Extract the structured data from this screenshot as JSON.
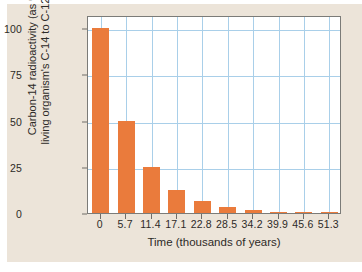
{
  "figure": {
    "background_color": "#ece4d9",
    "plot_background_color": "#ffffff",
    "bar_color": "#ea7b3c",
    "grid_color": "#a9cfe9",
    "axis_color": "#7b7b78"
  },
  "axis_titles": {
    "y_line1": "Carbon-14 radioactivity (as % of",
    "y_line2": "living organism's C-14 to C-12 ratio)",
    "x": "Time (thousands of years)"
  },
  "chart_data": {
    "type": "bar",
    "title": "",
    "xlabel": "Time (thousands of years)",
    "ylabel": "Carbon-14 radioactivity (as % of living organism's C-14 to C-12 ratio)",
    "categories": [
      "0",
      "5.7",
      "11.4",
      "17.1",
      "22.8",
      "28.5",
      "34.2",
      "39.9",
      "45.6",
      "51.3"
    ],
    "values": [
      100,
      50,
      25,
      12.5,
      6.25,
      3.125,
      1.5625,
      0.78,
      0.39,
      0.195
    ],
    "ylim": [
      0,
      107
    ],
    "yticks": [
      "0",
      "25",
      "50",
      "75",
      "100"
    ],
    "ytick_values": [
      0,
      25,
      50,
      75,
      100
    ],
    "xtick_values": [
      0,
      5.7,
      11.4,
      17.1,
      22.8,
      28.5,
      34.2,
      39.9,
      45.6,
      51.3
    ],
    "grid": true,
    "legend": "none",
    "half_life_thousands_years": 5.7
  }
}
